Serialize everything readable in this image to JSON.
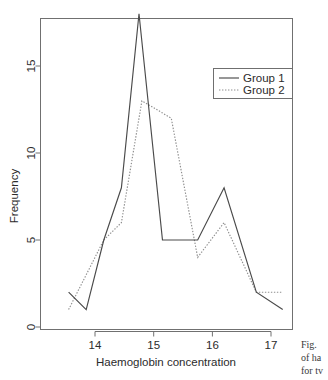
{
  "figure": {
    "background_color": "#ffffff",
    "frame_color": "#707070"
  },
  "chart_data": {
    "type": "line",
    "title": "",
    "xlabel": "Haemoglobin concentration",
    "ylabel": "Frequency",
    "xlim": [
      13.4,
      17.45
    ],
    "ylim": [
      -0.35,
      18.4
    ],
    "xticks": [
      14,
      15,
      16,
      17
    ],
    "xtick_labels": [
      "14",
      "15",
      "16",
      "17"
    ],
    "yticks": [
      0,
      5,
      10,
      15
    ],
    "ytick_labels": [
      "0",
      "5",
      "10",
      "15"
    ],
    "grid": false,
    "legend_position": "top-right",
    "series": [
      {
        "name": "Group 1",
        "style": "solid",
        "color": "#4a4a4a",
        "x": [
          13.55,
          13.85,
          14.15,
          14.45,
          14.75,
          15.15,
          15.75,
          16.2,
          16.75,
          17.2
        ],
        "values": [
          2,
          1,
          5,
          8,
          18,
          5,
          5,
          8,
          2,
          1
        ]
      },
      {
        "name": "Group 2",
        "style": "dotted",
        "color": "#8e8e8e",
        "x": [
          13.55,
          14.15,
          14.45,
          14.8,
          15.3,
          15.75,
          16.2,
          16.75,
          17.2
        ],
        "values": [
          1,
          5,
          6,
          13,
          12,
          4,
          6,
          2,
          2
        ]
      }
    ]
  },
  "legend": {
    "entries": [
      {
        "label": "Group 1",
        "style": "solid"
      },
      {
        "label": "Group 2",
        "style": "dotted"
      }
    ]
  },
  "caption": {
    "lines": [
      "Fig.",
      "of ha",
      "for tv"
    ]
  }
}
